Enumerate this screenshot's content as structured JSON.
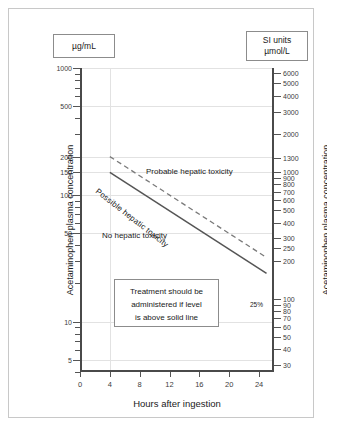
{
  "chart_data": {
    "type": "line",
    "xlabel": "Hours after ingestion",
    "ylabel": "Acetaminophen plasma concentration",
    "ylabel_right": "Acetaminophen plasma concentration",
    "xlim": [
      0,
      26
    ],
    "ylim_left": [
      4,
      1000
    ],
    "yscale": "log",
    "xticks": [
      0,
      4,
      8,
      12,
      16,
      20,
      24
    ],
    "xticklabels": [
      "0",
      "4",
      "8",
      "12",
      "16",
      "20",
      "24"
    ],
    "yticklabels_left": [
      "1000",
      "500",
      "200",
      "150",
      "100",
      "50",
      "10",
      "5"
    ],
    "ytickvalues_left": [
      1000,
      500,
      200,
      150,
      100,
      50,
      10,
      5
    ],
    "yticklabels_right": [
      "6000",
      "5000",
      "4000",
      "3000",
      "2000",
      "1300",
      "1000",
      "900",
      "800",
      "700",
      "600",
      "500",
      "400",
      "300",
      "250",
      "200",
      "100",
      "90",
      "80",
      "70",
      "60",
      "50",
      "40",
      "30",
      "20",
      "10"
    ],
    "ytickvalues_right": [
      6000,
      5000,
      4000,
      3000,
      2000,
      1300,
      1000,
      900,
      800,
      700,
      600,
      500,
      400,
      300,
      250,
      200,
      100,
      90,
      80,
      70,
      60,
      50,
      40,
      30,
      20,
      10
    ],
    "grid": true,
    "legend": "none",
    "series": [
      {
        "name": "Probable hepatic toxicity line (upper, dashed, 200 ug/mL at 4h)",
        "style": "dashed",
        "color": "#7a7a7a",
        "points": [
          {
            "hours": 4,
            "ug_per_mL": 200
          },
          {
            "hours": 25,
            "ug_per_mL": 32
          }
        ]
      },
      {
        "name": "Treatment line (lower, solid, 150 ug/mL at 4h, 25% line)",
        "style": "solid",
        "color": "#555555",
        "points": [
          {
            "hours": 4,
            "ug_per_mL": 150
          },
          {
            "hours": 25,
            "ug_per_mL": 24
          }
        ]
      }
    ],
    "annotations": [
      {
        "text": "Probable hepatic toxicity",
        "hours": 13,
        "ug_per_mL": 85
      },
      {
        "text": "No hepatic toxicity",
        "hours": 6.5,
        "ug_per_mL": 22
      },
      {
        "text": "Possible hepatic toxicity",
        "hours": 10,
        "ug_per_mL": 45,
        "rotation": 38
      },
      {
        "text": "25%",
        "hours": 25.5,
        "ug_per_mL": 7
      }
    ]
  },
  "units": {
    "left_label": "µg/mL",
    "right_line1": "SI units",
    "right_line2": "µmol/L"
  },
  "axes": {
    "y_title_left": "Acetaminophen plasma concentration",
    "y_title_right": "Acetaminophen plasma concentration",
    "x_title": "Hours after ingestion"
  },
  "regions": {
    "probable": "Probable hepatic toxicity",
    "possible": "Possible hepatic toxicity",
    "none": "No hepatic toxicity"
  },
  "treatment_note": {
    "line1": "Treatment should be",
    "line2": "administered if level",
    "line3": "is above solid line"
  },
  "percent_label": "25%"
}
